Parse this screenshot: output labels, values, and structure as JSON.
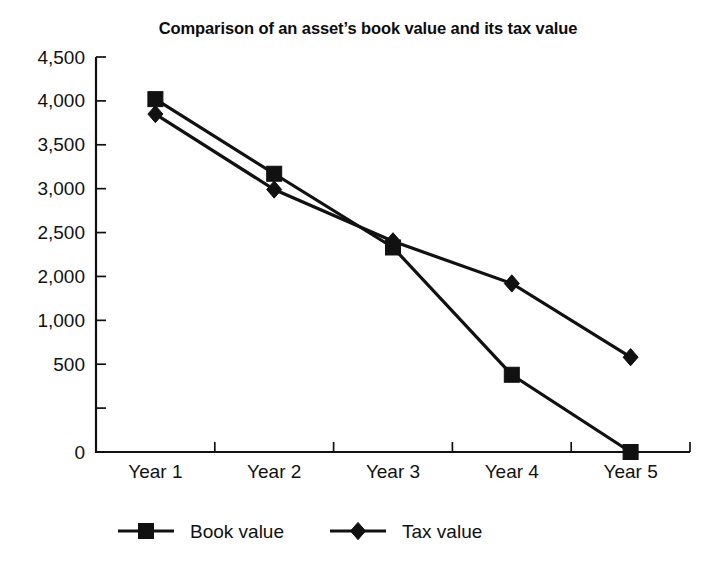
{
  "chart_data": {
    "type": "line",
    "title": "Comparison of an asset’s book value and its tax value",
    "xlabel": "",
    "ylabel": "",
    "categories": [
      "Year 1",
      "Year 2",
      "Year 3",
      "Year 4",
      "Year 5"
    ],
    "ylim": [
      0,
      4500
    ],
    "ytick_values": [
      4500,
      4000,
      3500,
      3000,
      2500,
      2000,
      1500,
      1000,
      500,
      0
    ],
    "ytick_labels": [
      "4,500",
      "4,000",
      "3,500",
      "3,000",
      "2,500",
      "2,000",
      "1,000",
      "500",
      "",
      "0"
    ],
    "grid": false,
    "legend_position": "bottom",
    "series": [
      {
        "name": "Book value",
        "marker": "square",
        "color": "#111111",
        "values": [
          4020,
          3170,
          2330,
          880,
          0
        ]
      },
      {
        "name": "Tax value",
        "marker": "diamond",
        "color": "#111111",
        "values": [
          3850,
          2990,
          2400,
          1920,
          1080
        ]
      }
    ]
  },
  "legend": {
    "items": [
      {
        "label": "Book value",
        "marker": "square"
      },
      {
        "label": "Tax value",
        "marker": "diamond"
      }
    ]
  },
  "colors": {
    "ink": "#111111",
    "background": "#ffffff"
  }
}
